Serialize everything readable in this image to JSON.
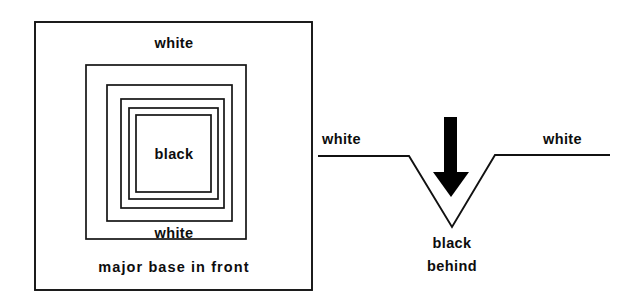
{
  "figure": {
    "background_color": "#ffffff",
    "ink_color": "#111111",
    "width": 619,
    "height": 307
  },
  "left_panel": {
    "name": "plan-view-nested-squares",
    "outer_frame": {
      "x": 35,
      "y": 22,
      "width": 277,
      "height": 268
    },
    "nested_squares": [
      {
        "index": 1,
        "x": 86,
        "y": 65,
        "width": 160,
        "height": 174
      },
      {
        "index": 2,
        "x": 107,
        "y": 85,
        "width": 125,
        "height": 136
      },
      {
        "index": 3,
        "x": 121,
        "y": 99,
        "width": 103,
        "height": 109
      },
      {
        "index": 4,
        "x": 129,
        "y": 108,
        "width": 89,
        "height": 91
      },
      {
        "index": 5,
        "x": 136,
        "y": 115,
        "width": 75,
        "height": 77
      }
    ],
    "labels": {
      "top": "white",
      "center": "black",
      "bottom": "white",
      "caption": "major base in front"
    },
    "label_positions": {
      "top": {
        "x": 174,
        "y": 48
      },
      "center": {
        "x": 174,
        "y": 159
      },
      "bottom": {
        "x": 174,
        "y": 238
      },
      "caption": {
        "x": 174,
        "y": 272
      }
    }
  },
  "right_panel": {
    "name": "cross-section-profile",
    "profile_points": "318,156 409,156 452,227 495,155 610,155",
    "arrow": {
      "shaft": {
        "x": 444,
        "y": 117,
        "width": 13,
        "height": 63
      },
      "head_points": "433,172 469,172 451,197"
    },
    "labels": {
      "left": "white",
      "right": "white",
      "below_line1": "black",
      "below_line2": "behind"
    },
    "label_positions": {
      "left": {
        "x": 322,
        "y": 144
      },
      "right": {
        "x": 543,
        "y": 144
      },
      "below_line1": {
        "x": 452,
        "y": 248
      },
      "below_line2": {
        "x": 452,
        "y": 271
      }
    }
  }
}
